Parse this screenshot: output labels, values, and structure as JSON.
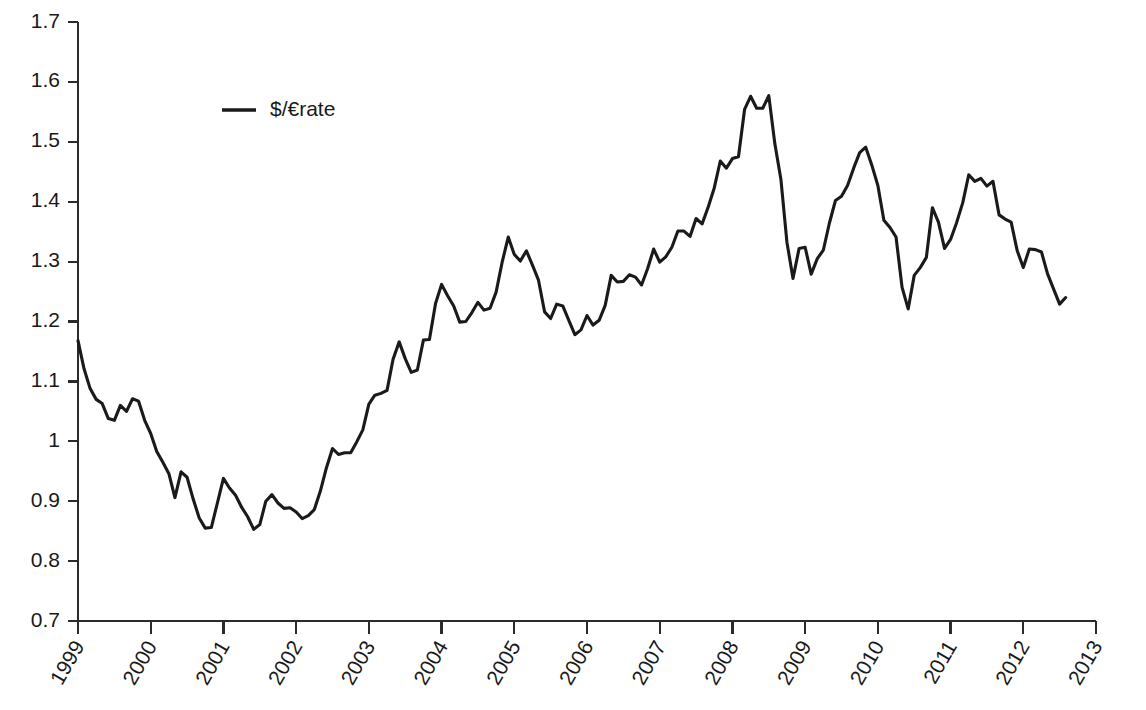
{
  "chart_data": {
    "type": "line",
    "title": "",
    "subtitle": "",
    "xlabel": "",
    "ylabel": "",
    "grid": false,
    "legend_position": "top-left-inside",
    "ylim": [
      0.7,
      1.7
    ],
    "xlim": [
      1999,
      2013
    ],
    "ytick_labels": [
      "1.7",
      "1.6",
      "1.5",
      "1.4",
      "1.3",
      "1.2",
      "1.1",
      "1",
      "0.9",
      "0.8",
      "0.7"
    ],
    "ytick_values": [
      1.7,
      1.6,
      1.5,
      1.4,
      1.3,
      1.2,
      1.1,
      1.0,
      0.9,
      0.8,
      0.7
    ],
    "xtick_labels": [
      "1999",
      "2000",
      "2001",
      "2002",
      "2003",
      "2004",
      "2005",
      "2006",
      "2007",
      "2008",
      "2009",
      "2010",
      "2011",
      "2012",
      "2013"
    ],
    "xtick_values": [
      1999,
      2000,
      2001,
      2002,
      2003,
      2004,
      2005,
      2006,
      2007,
      2008,
      2009,
      2010,
      2011,
      2012,
      2013
    ],
    "xtick_rotation_deg": 60,
    "line_color": "#1a1a1a",
    "series": [
      {
        "name": "$/€rate",
        "legend_label": "$/€rate",
        "color": "#1a1a1a",
        "x": [
          1999.0,
          1999.083,
          1999.167,
          1999.25,
          1999.333,
          1999.417,
          1999.5,
          1999.583,
          1999.667,
          1999.75,
          1999.833,
          1999.917,
          2000.0,
          2000.083,
          2000.167,
          2000.25,
          2000.333,
          2000.417,
          2000.5,
          2000.583,
          2000.667,
          2000.75,
          2000.833,
          2000.917,
          2001.0,
          2001.083,
          2001.167,
          2001.25,
          2001.333,
          2001.417,
          2001.5,
          2001.583,
          2001.667,
          2001.75,
          2001.833,
          2001.917,
          2002.0,
          2002.083,
          2002.167,
          2002.25,
          2002.333,
          2002.417,
          2002.5,
          2002.583,
          2002.667,
          2002.75,
          2002.833,
          2002.917,
          2003.0,
          2003.083,
          2003.167,
          2003.25,
          2003.333,
          2003.417,
          2003.5,
          2003.583,
          2003.667,
          2003.75,
          2003.833,
          2003.917,
          2004.0,
          2004.083,
          2004.167,
          2004.25,
          2004.333,
          2004.417,
          2004.5,
          2004.583,
          2004.667,
          2004.75,
          2004.833,
          2004.917,
          2005.0,
          2005.083,
          2005.167,
          2005.25,
          2005.333,
          2005.417,
          2005.5,
          2005.583,
          2005.667,
          2005.75,
          2005.833,
          2005.917,
          2006.0,
          2006.083,
          2006.167,
          2006.25,
          2006.333,
          2006.417,
          2006.5,
          2006.583,
          2006.667,
          2006.75,
          2006.833,
          2006.917,
          2007.0,
          2007.083,
          2007.167,
          2007.25,
          2007.333,
          2007.417,
          2007.5,
          2007.583,
          2007.667,
          2007.75,
          2007.833,
          2007.917,
          2008.0,
          2008.083,
          2008.167,
          2008.25,
          2008.333,
          2008.417,
          2008.5,
          2008.583,
          2008.667,
          2008.75,
          2008.833,
          2008.917,
          2009.0,
          2009.083,
          2009.167,
          2009.25,
          2009.333,
          2009.417,
          2009.5,
          2009.583,
          2009.667,
          2009.75,
          2009.833,
          2009.917,
          2010.0,
          2010.083,
          2010.167,
          2010.25,
          2010.333,
          2010.417,
          2010.5,
          2010.583,
          2010.667,
          2010.75,
          2010.833,
          2010.917,
          2011.0,
          2011.083,
          2011.167,
          2011.25,
          2011.333,
          2011.417,
          2011.5,
          2011.583,
          2011.667,
          2011.75,
          2011.833,
          2011.917,
          2012.0,
          2012.083,
          2012.167,
          2012.25,
          2012.333,
          2012.417,
          2012.5,
          2012.583
        ],
        "values": [
          1.168,
          1.121,
          1.088,
          1.07,
          1.063,
          1.038,
          1.035,
          1.06,
          1.05,
          1.071,
          1.067,
          1.035,
          1.013,
          0.983,
          0.965,
          0.946,
          0.906,
          0.949,
          0.94,
          0.904,
          0.872,
          0.855,
          0.856,
          0.897,
          0.938,
          0.922,
          0.91,
          0.89,
          0.874,
          0.853,
          0.861,
          0.9,
          0.911,
          0.897,
          0.888,
          0.889,
          0.882,
          0.871,
          0.876,
          0.886,
          0.917,
          0.956,
          0.988,
          0.978,
          0.981,
          0.981,
          0.999,
          1.019,
          1.062,
          1.077,
          1.08,
          1.085,
          1.137,
          1.166,
          1.138,
          1.115,
          1.119,
          1.169,
          1.17,
          1.23,
          1.262,
          1.243,
          1.226,
          1.199,
          1.2,
          1.215,
          1.232,
          1.219,
          1.222,
          1.249,
          1.299,
          1.341,
          1.312,
          1.301,
          1.318,
          1.294,
          1.269,
          1.216,
          1.205,
          1.229,
          1.226,
          1.202,
          1.178,
          1.186,
          1.21,
          1.194,
          1.202,
          1.227,
          1.277,
          1.266,
          1.267,
          1.278,
          1.274,
          1.261,
          1.288,
          1.321,
          1.299,
          1.308,
          1.324,
          1.351,
          1.351,
          1.342,
          1.372,
          1.363,
          1.391,
          1.423,
          1.468,
          1.456,
          1.472,
          1.475,
          1.554,
          1.576,
          1.556,
          1.556,
          1.577,
          1.497,
          1.437,
          1.332,
          1.272,
          1.322,
          1.324,
          1.279,
          1.305,
          1.319,
          1.364,
          1.402,
          1.409,
          1.427,
          1.456,
          1.482,
          1.491,
          1.461,
          1.427,
          1.369,
          1.357,
          1.341,
          1.257,
          1.221,
          1.277,
          1.29,
          1.307,
          1.39,
          1.366,
          1.322,
          1.337,
          1.365,
          1.398,
          1.445,
          1.434,
          1.439,
          1.426,
          1.434,
          1.378,
          1.371,
          1.366,
          1.318,
          1.29,
          1.321,
          1.32,
          1.316,
          1.28,
          1.254,
          1.229,
          1.24
        ]
      }
    ],
    "annotations": [],
    "notable_points": {
      "start": {
        "x": 1999.0,
        "y": 1.168
      },
      "minimum": {
        "x": 2000.833,
        "y": 0.855
      },
      "maximum": {
        "x": 2008.5,
        "y": 1.577
      },
      "end": {
        "x": 2012.583,
        "y": 1.24
      }
    }
  },
  "legend": {
    "entries": [
      {
        "label": "$/€rate",
        "marker": "line"
      }
    ]
  },
  "axes": {
    "y": {
      "labels": [
        "1.7",
        "1.6",
        "1.5",
        "1.4",
        "1.3",
        "1.2",
        "1.1",
        "1",
        "0.9",
        "0.8",
        "0.7"
      ]
    },
    "x": {
      "labels": [
        "1999",
        "2000",
        "2001",
        "2002",
        "2003",
        "2004",
        "2005",
        "2006",
        "2007",
        "2008",
        "2009",
        "2010",
        "2011",
        "2012",
        "2013"
      ]
    }
  }
}
